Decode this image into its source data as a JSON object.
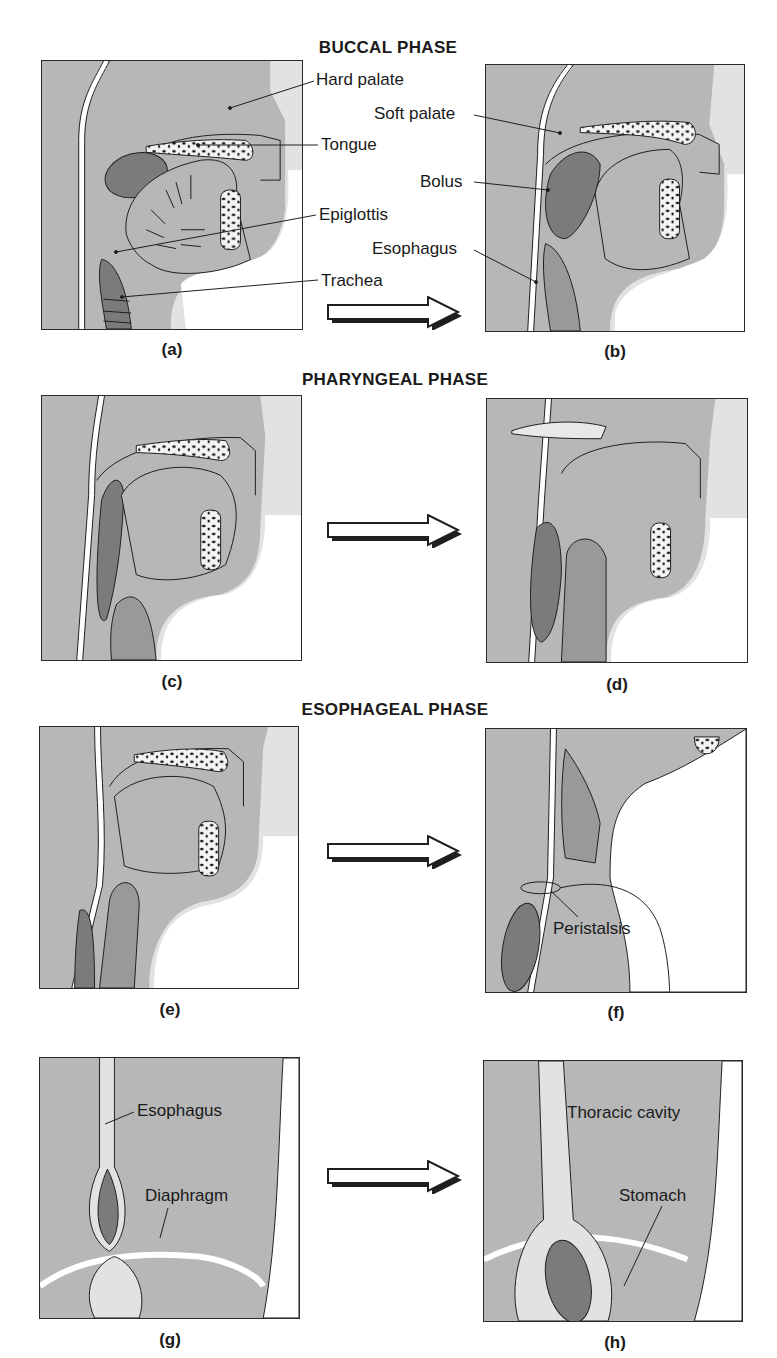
{
  "colors": {
    "tissue": "#b7b7b7",
    "airway": "#e2e2e2",
    "dark_structure": "#7b7b7b",
    "mid_structure": "#999999",
    "outline": "#1f1f1f",
    "background": "#ffffff"
  },
  "phases": [
    {
      "title": "BUCCAL PHASE",
      "panels": [
        "a",
        "b"
      ]
    },
    {
      "title": "PHARYNGEAL PHASE",
      "panels": [
        "c",
        "d"
      ]
    },
    {
      "title": "ESOPHAGEAL PHASE",
      "panels": [
        "e",
        "f"
      ]
    },
    {
      "title": "",
      "panels": [
        "g",
        "h"
      ]
    }
  ],
  "panels": {
    "a": {
      "caption": "(a)"
    },
    "b": {
      "caption": "(b)"
    },
    "c": {
      "caption": "(c)"
    },
    "d": {
      "caption": "(d)"
    },
    "e": {
      "caption": "(e)"
    },
    "f": {
      "caption": "(f)"
    },
    "g": {
      "caption": "(g)"
    },
    "h": {
      "caption": "(h)"
    }
  },
  "labels": {
    "hard_palate": "Hard palate",
    "soft_palate": "Soft palate",
    "tongue": "Tongue",
    "bolus": "Bolus",
    "epiglottis": "Epiglottis",
    "esophagus_b": "Esophagus",
    "trachea": "Trachea",
    "peristalsis": "Peristalsis",
    "esophagus_g": "Esophagus",
    "diaphragm": "Diaphragm",
    "thoracic_cavity": "Thoracic cavity",
    "stomach": "Stomach"
  },
  "arrows": [
    {
      "from": "a",
      "to": "b",
      "icon": "right-arrow-icon"
    },
    {
      "from": "c",
      "to": "d",
      "icon": "right-arrow-icon"
    },
    {
      "from": "e",
      "to": "f",
      "icon": "right-arrow-icon"
    },
    {
      "from": "g",
      "to": "h",
      "icon": "right-arrow-icon"
    }
  ]
}
